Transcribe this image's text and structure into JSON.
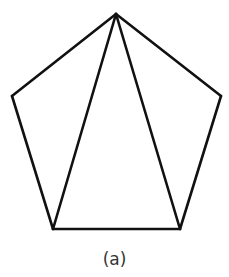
{
  "diagram": {
    "type": "pentagon-triangulation",
    "caption": "(a)",
    "stroke_color": "#111111",
    "vertices": {
      "top": [
        116,
        14
      ],
      "right": [
        221,
        96
      ],
      "bottom_right": [
        180,
        229
      ],
      "bottom_left": [
        53,
        229
      ],
      "left": [
        12,
        96
      ]
    },
    "edges": [
      [
        "top",
        "right"
      ],
      [
        "right",
        "bottom_right"
      ],
      [
        "bottom_right",
        "bottom_left"
      ],
      [
        "bottom_left",
        "left"
      ],
      [
        "left",
        "top"
      ]
    ],
    "diagonals": [
      [
        "top",
        "bottom_left"
      ],
      [
        "top",
        "bottom_right"
      ]
    ]
  }
}
